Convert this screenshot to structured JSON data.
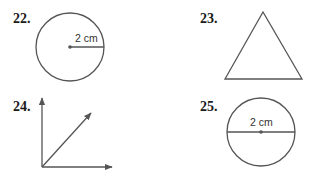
{
  "problems": [
    {
      "number": "22.",
      "figure": "circle-with-radius",
      "measure_label": "2 cm"
    },
    {
      "number": "23.",
      "figure": "triangle"
    },
    {
      "number": "24.",
      "figure": "angle-with-three-rays"
    },
    {
      "number": "25.",
      "figure": "circle-with-diameter",
      "measure_label": "2 cm"
    }
  ],
  "colors": {
    "stroke": "#555555",
    "text": "#1a1a1a"
  }
}
